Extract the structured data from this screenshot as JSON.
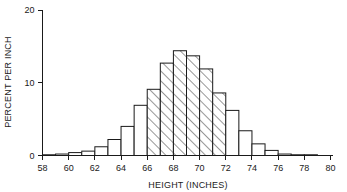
{
  "chart_data": {
    "type": "bar",
    "title": "",
    "subtitle": "",
    "xlabel": "HEIGHT (INCHES)",
    "ylabel": "PERCENT PER INCH",
    "xlim": [
      58,
      80
    ],
    "ylim": [
      0,
      20
    ],
    "grid": false,
    "legend": null,
    "legend_position": "none",
    "xticks": [
      58,
      60,
      62,
      64,
      66,
      68,
      70,
      72,
      74,
      76,
      78,
      80
    ],
    "xtick_labels": [
      "58",
      "60",
      "62",
      "64",
      "66",
      "68",
      "70",
      "72",
      "74",
      "76",
      "78",
      "80"
    ],
    "yticks": [
      0,
      10,
      20
    ],
    "ytick_labels": [
      "0",
      "10",
      "20"
    ],
    "bin_width": 1,
    "bin_edges": [
      58,
      59,
      60,
      61,
      62,
      63,
      64,
      65,
      66,
      67,
      68,
      69,
      70,
      71,
      72,
      73,
      74,
      75,
      76,
      77,
      78,
      79
    ],
    "categories": [
      "58-59",
      "59-60",
      "60-61",
      "61-62",
      "62-63",
      "63-64",
      "64-65",
      "65-66",
      "66-67",
      "67-68",
      "68-69",
      "69-70",
      "70-71",
      "71-72",
      "72-73",
      "73-74",
      "74-75",
      "75-76",
      "76-77",
      "77-78",
      "78-79"
    ],
    "values": [
      0.1,
      0.2,
      0.4,
      0.6,
      1.2,
      2.2,
      4.0,
      6.9,
      9.1,
      12.7,
      14.4,
      13.7,
      11.9,
      8.6,
      6.2,
      3.4,
      1.6,
      0.7,
      0.2,
      0.1,
      0.1
    ],
    "shaded_range": [
      66,
      72
    ],
    "shaded_style": "diagonal-hatch",
    "bar_fill_color": "#ffffff",
    "bar_edge_color": "#1a1a1a",
    "hatch_color": "#1a1a1a",
    "annotations": []
  }
}
